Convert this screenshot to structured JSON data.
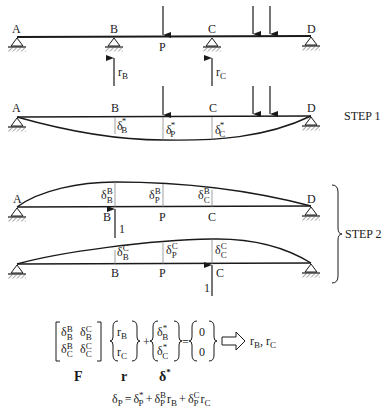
{
  "figure": {
    "points": {
      "A": "A",
      "B": "B",
      "P": "P",
      "C": "C",
      "D": "D"
    },
    "original_structure": {
      "reaction_B": "r",
      "reaction_B_sub": "B",
      "reaction_C": "r",
      "reaction_C_sub": "C"
    },
    "step1": {
      "label": "STEP 1",
      "delta": "δ",
      "star": "*",
      "defl_B_sub": "B",
      "defl_P_sub": "P",
      "defl_C_sub": "C"
    },
    "step2": {
      "label": "STEP 2",
      "unit_load": "1",
      "case_B": {
        "sup": "B",
        "subs": [
          "B",
          "P",
          "C"
        ]
      },
      "case_C": {
        "sup": "C",
        "subs": [
          "B",
          "P",
          "C"
        ]
      }
    },
    "equation": {
      "matrix_F": [
        [
          "B",
          "B"
        ],
        [
          "B",
          "C"
        ],
        [
          "C",
          "B"
        ],
        [
          "C",
          "C"
        ]
      ],
      "F_label": "F",
      "r_label": "r",
      "delta_star_label": "δ",
      "star": "*",
      "plus": "+",
      "equals": "=",
      "zero": "0",
      "result": "r",
      "result_B_sub": "B",
      "result_sep": ",",
      "result_C_sub": "C",
      "final_eq": {
        "lhs": "δ",
        "lhs_sub": "P",
        "t1": "δ",
        "t1_sup": "*",
        "t1_sub": "P",
        "t2": "δ",
        "t2_sup": "B",
        "t2_sub": "P",
        "t2_r": "r",
        "t2_r_sub": "B",
        "t3": "δ",
        "t3_sup": "C",
        "t3_sub": "P",
        "t3_r": "r",
        "t3_r_sub": "C"
      }
    }
  }
}
